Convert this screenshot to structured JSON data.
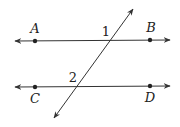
{
  "diagram": {
    "colors": {
      "line": "#333333",
      "background": "#ffffff"
    },
    "points": [
      {
        "name": "A",
        "x": 35,
        "y": 41,
        "label_x": 35,
        "label_y": 33
      },
      {
        "name": "B",
        "x": 150,
        "y": 40,
        "label_x": 150,
        "label_y": 32
      },
      {
        "name": "C",
        "x": 35,
        "y": 87,
        "label_x": 35,
        "label_y": 103
      },
      {
        "name": "D",
        "x": 150,
        "y": 86,
        "label_x": 150,
        "label_y": 102
      }
    ],
    "lines": [
      {
        "name": "line-AB",
        "x1": 15,
        "y1": 41,
        "x2": 170,
        "y2": 40
      },
      {
        "name": "line-CD",
        "x1": 15,
        "y1": 87,
        "x2": 170,
        "y2": 86
      },
      {
        "name": "transversal",
        "x1": 133,
        "y1": 9,
        "x2": 54,
        "y2": 118
      }
    ],
    "angles": [
      {
        "label": "1",
        "x": 106,
        "y": 36
      },
      {
        "label": "2",
        "x": 73,
        "y": 82
      }
    ],
    "point_labels": {
      "A": "A",
      "B": "B",
      "C": "C",
      "D": "D"
    },
    "angle_labels": {
      "one": "1",
      "two": "2"
    }
  }
}
